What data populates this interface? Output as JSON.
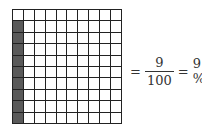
{
  "grid": {
    "rows": 10,
    "cols": 10,
    "shaded_column": 0,
    "shaded_rows": [
      1,
      2,
      3,
      4,
      5,
      6,
      7,
      8,
      9
    ],
    "shaded_count": 9,
    "colors": {
      "shaded": "#5a5a5a",
      "empty": "#ffffff",
      "line": "#222222"
    }
  },
  "equation": {
    "eq1": "=",
    "numerator": "9",
    "denominator": "100",
    "eq2": "=",
    "result": "9 %"
  }
}
